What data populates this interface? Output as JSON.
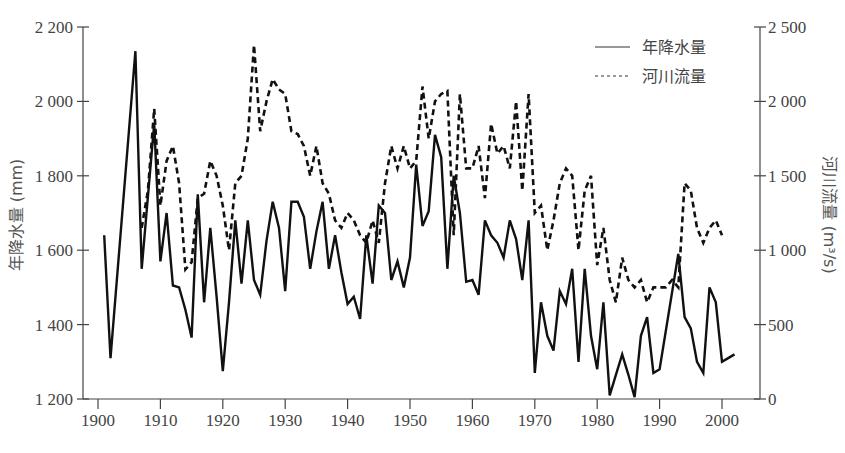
{
  "chart_data": {
    "type": "line",
    "title": "",
    "xlabel": "",
    "ylabel": "年降水量 (mm)",
    "y2label": "河川流量 (m³/s)",
    "xlim": [
      1900,
      2000
    ],
    "ylim": [
      1200,
      2200
    ],
    "y2lim": [
      0,
      2500
    ],
    "grid": false,
    "legend_position": "top-right",
    "x_ticks": [
      1900,
      1910,
      1920,
      1930,
      1940,
      1950,
      1960,
      1970,
      1980,
      1990,
      2000
    ],
    "y_ticks": [
      "1 200",
      "1 400",
      "1 600",
      "1 800",
      "2 000",
      "2 200"
    ],
    "y2_ticks": [
      "0",
      "500",
      "1 000",
      "1 500",
      "2 000",
      "2 500"
    ],
    "series": [
      {
        "name": "年降水量",
        "axis": "left",
        "style": "solid",
        "x": [
          1901,
          1902,
          1906,
          1907,
          1909,
          1910,
          1911,
          1912,
          1913,
          1914,
          1915,
          1916,
          1917,
          1918,
          1919,
          1920,
          1921,
          1922,
          1923,
          1924,
          1925,
          1926,
          1927,
          1928,
          1929,
          1930,
          1931,
          1932,
          1933,
          1934,
          1935,
          1936,
          1937,
          1938,
          1939,
          1940,
          1941,
          1942,
          1943,
          1944,
          1945,
          1946,
          1947,
          1948,
          1949,
          1950,
          1951,
          1952,
          1953,
          1954,
          1955,
          1956,
          1957,
          1958,
          1959,
          1960,
          1961,
          1962,
          1963,
          1964,
          1965,
          1966,
          1967,
          1968,
          1969,
          1970,
          1971,
          1972,
          1973,
          1974,
          1975,
          1976,
          1977,
          1978,
          1979,
          1980,
          1981,
          1982,
          1983,
          1984,
          1985,
          1986,
          1987,
          1988,
          1989,
          1990,
          1993,
          1994,
          1995,
          1996,
          1997,
          1998,
          1999,
          2000,
          2001,
          2002
        ],
        "values": [
          1640,
          1310,
          2135,
          1550,
          1940,
          1570,
          1700,
          1505,
          1500,
          1440,
          1365,
          1750,
          1460,
          1660,
          1475,
          1275,
          1460,
          1680,
          1510,
          1680,
          1520,
          1480,
          1625,
          1730,
          1660,
          1490,
          1730,
          1730,
          1690,
          1550,
          1650,
          1730,
          1550,
          1640,
          1540,
          1455,
          1475,
          1415,
          1640,
          1510,
          1720,
          1700,
          1520,
          1570,
          1500,
          1580,
          1830,
          1665,
          1705,
          1910,
          1850,
          1550,
          1800,
          1700,
          1515,
          1520,
          1480,
          1680,
          1640,
          1620,
          1580,
          1680,
          1630,
          1520,
          1680,
          1270,
          1460,
          1370,
          1330,
          1490,
          1455,
          1550,
          1300,
          1550,
          1370,
          1280,
          1460,
          1210,
          1265,
          1320,
          1265,
          1205,
          1370,
          1420,
          1270,
          1280,
          1590,
          1420,
          1390,
          1300,
          1270,
          1500,
          1460,
          1300,
          1310,
          1320
        ],
        "color": "#111111"
      },
      {
        "name": "河川流量",
        "axis": "right",
        "style": "dashed",
        "x": [
          1907,
          1908,
          1909,
          1910,
          1911,
          1912,
          1913,
          1914,
          1915,
          1916,
          1917,
          1918,
          1919,
          1920,
          1921,
          1922,
          1923,
          1924,
          1925,
          1926,
          1927,
          1928,
          1929,
          1930,
          1931,
          1932,
          1933,
          1934,
          1935,
          1936,
          1937,
          1938,
          1939,
          1940,
          1941,
          1942,
          1943,
          1944,
          1945,
          1946,
          1947,
          1948,
          1949,
          1950,
          1951,
          1952,
          1953,
          1954,
          1955,
          1956,
          1957,
          1958,
          1959,
          1960,
          1961,
          1962,
          1963,
          1964,
          1965,
          1966,
          1967,
          1968,
          1969,
          1970,
          1971,
          1972,
          1973,
          1974,
          1975,
          1976,
          1977,
          1978,
          1979,
          1980,
          1981,
          1982,
          1983,
          1984,
          1985,
          1986,
          1987,
          1988,
          1989,
          1990,
          1991,
          1992,
          1993,
          1994,
          1995,
          1996,
          1997,
          1998,
          1999,
          2000
        ],
        "values": [
          1150,
          1400,
          1950,
          1300,
          1600,
          1700,
          1450,
          870,
          920,
          1350,
          1380,
          1600,
          1500,
          1300,
          1000,
          1450,
          1500,
          1750,
          2380,
          1800,
          2000,
          2150,
          2080,
          2050,
          1800,
          1780,
          1700,
          1500,
          1700,
          1450,
          1380,
          1200,
          1150,
          1250,
          1200,
          1100,
          1050,
          1200,
          1050,
          1450,
          1700,
          1550,
          1700,
          1550,
          1600,
          2100,
          1750,
          2000,
          2050,
          2070,
          1100,
          2050,
          1550,
          1550,
          1700,
          1350,
          1850,
          1650,
          1700,
          1550,
          2000,
          1400,
          2050,
          1250,
          1300,
          1000,
          1200,
          1450,
          1550,
          1500,
          1000,
          1400,
          1500,
          900,
          1150,
          800,
          650,
          950,
          800,
          750,
          800,
          650,
          750,
          750,
          750,
          800,
          750,
          1450,
          1400,
          1150,
          1050,
          1150,
          1200,
          1100
        ],
        "color": "#111111"
      }
    ]
  },
  "legend": {
    "items": [
      {
        "label": "年降水量",
        "style": "solid"
      },
      {
        "label": "河川流量",
        "style": "dashed"
      }
    ]
  },
  "axes": {
    "left_title": "年降水量 (mm)",
    "right_title": "河川流量 (m³/s)",
    "x_ticks": [
      "1900",
      "1910",
      "1920",
      "1930",
      "1940",
      "1950",
      "1960",
      "1970",
      "1980",
      "1990",
      "2000"
    ],
    "left_ticks": [
      "1 200",
      "1 400",
      "1 600",
      "1 800",
      "2 000",
      "2 200"
    ],
    "right_ticks": [
      "0",
      "500",
      "1 000",
      "1 500",
      "2 000",
      "2 500"
    ]
  }
}
